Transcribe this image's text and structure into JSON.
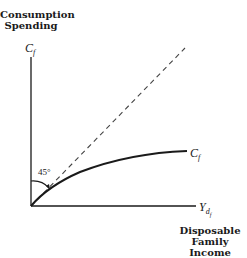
{
  "diagram": {
    "y_axis_label_line1": "Consumption",
    "y_axis_label_line2": "Spending",
    "y_axis_symbol": "C",
    "y_axis_symbol_sub": "f",
    "x_axis_symbol": "Y",
    "x_axis_symbol_sub": "d",
    "x_axis_symbol_subsub": "f",
    "x_axis_label_line1": "Disposable",
    "x_axis_label_line2": "Family Income",
    "curve_label": "C",
    "curve_label_sub": "f",
    "angle_label": "45°",
    "reference_line": "45-degree line (dashed)",
    "curve": "concave consumption curve rising from origin"
  }
}
